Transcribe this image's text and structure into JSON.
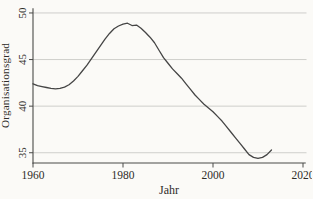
{
  "figure": {
    "background_color": "#fbfaf7",
    "line_color": "#454545",
    "grid_color": "#c9c9c6",
    "axis_color": "#4a4a48",
    "text_color": "#2e2c28"
  },
  "chart_data": {
    "type": "line",
    "xlabel": "Jahr",
    "ylabel": "Organisationsgrad",
    "xlim": [
      1960,
      2020.5
    ],
    "ylim": [
      33.9,
      50.5
    ],
    "x_ticks": [
      1960,
      1980,
      2000,
      2020
    ],
    "y_ticks": [
      35,
      40,
      45,
      50
    ],
    "grid": "horizontal",
    "legend": "none",
    "series": [
      {
        "name": "Organisationsgrad",
        "x": [
          1960,
          1961,
          1962,
          1963,
          1964,
          1965,
          1966,
          1967,
          1968,
          1969,
          1970,
          1971,
          1972,
          1973,
          1974,
          1975,
          1976,
          1977,
          1978,
          1979,
          1980,
          1981,
          1982,
          1983,
          1984,
          1985,
          1986,
          1987,
          1988,
          1989,
          1990,
          1991,
          1992,
          1993,
          1994,
          1995,
          1996,
          1997,
          1998,
          1999,
          2000,
          2001,
          2002,
          2003,
          2004,
          2005,
          2006,
          2007,
          2008,
          2009,
          2010,
          2011,
          2012,
          2013
        ],
        "values": [
          42.4,
          42.2,
          42.1,
          42.0,
          41.9,
          41.85,
          41.9,
          42.05,
          42.3,
          42.7,
          43.2,
          43.8,
          44.4,
          45.1,
          45.8,
          46.5,
          47.2,
          47.8,
          48.3,
          48.6,
          48.8,
          48.9,
          48.65,
          48.7,
          48.35,
          47.9,
          47.4,
          46.8,
          46.0,
          45.2,
          44.6,
          44.0,
          43.5,
          43.0,
          42.4,
          41.8,
          41.2,
          40.7,
          40.2,
          39.8,
          39.4,
          38.9,
          38.4,
          37.8,
          37.2,
          36.6,
          36.0,
          35.4,
          34.8,
          34.5,
          34.4,
          34.5,
          34.8,
          35.3
        ]
      }
    ]
  }
}
